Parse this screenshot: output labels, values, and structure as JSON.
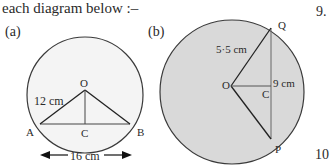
{
  "intro_text": "each diagram below :–",
  "question_numbers": {
    "right_top": "9.",
    "right_bottom": "10"
  },
  "diagram_a": {
    "label": "(a)",
    "points": {
      "center": "O",
      "left": "A",
      "right": "B",
      "foot": "C"
    },
    "radius_label": "12 cm",
    "chord_label": "16 cm"
  },
  "diagram_b": {
    "label": "(b)",
    "points": {
      "center": "O",
      "top": "Q",
      "bottom": "P",
      "foot": "C"
    },
    "radius_label": "5·5 cm",
    "chord_label": "9 cm",
    "fill_color": "#d9d9d9"
  }
}
